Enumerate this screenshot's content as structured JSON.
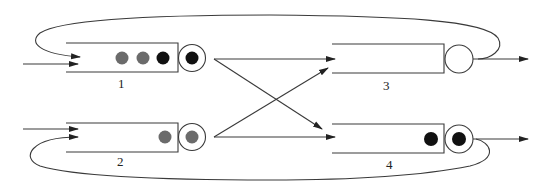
{
  "diagram": {
    "type": "queueing-network",
    "queues": [
      {
        "id": "1",
        "label": "1",
        "waiting_customers": [
          "gray",
          "gray",
          "black"
        ],
        "in_service": "black"
      },
      {
        "id": "2",
        "label": "2",
        "waiting_customers": [
          "gray"
        ],
        "in_service": "gray"
      },
      {
        "id": "3",
        "label": "3",
        "waiting_customers": [],
        "in_service": "empty"
      },
      {
        "id": "4",
        "label": "4",
        "waiting_customers": [
          "black"
        ],
        "in_service": "black"
      }
    ],
    "routes": [
      {
        "from": "external",
        "to": "1"
      },
      {
        "from": "external",
        "to": "2"
      },
      {
        "from": "1",
        "to": "3"
      },
      {
        "from": "1",
        "to": "4"
      },
      {
        "from": "2",
        "to": "3"
      },
      {
        "from": "2",
        "to": "4"
      },
      {
        "from": "3",
        "to": "1",
        "kind": "feedback-loop-top"
      },
      {
        "from": "4",
        "to": "2",
        "kind": "feedback-loop-bottom"
      },
      {
        "from": "3",
        "to": "exit"
      },
      {
        "from": "4",
        "to": "exit"
      }
    ],
    "colors": {
      "line": "#3a3a3a",
      "gray_customer": "#6b6b6b",
      "black_customer": "#111111"
    }
  }
}
